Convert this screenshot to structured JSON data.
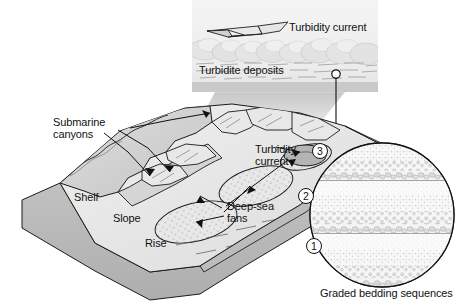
{
  "figure": {
    "background_color": "#ffffff"
  },
  "inset_panel": {
    "name": "turbidity-current-inset",
    "turbidity_current_label": "Turbidity current",
    "turbidite_deposits_label": "Turbidite deposits",
    "arrow_direction": "left",
    "panel_bounds": {
      "x": 192,
      "y": 0,
      "width": 186,
      "height": 92
    },
    "background_color": "#f2f2f2"
  },
  "block_diagram": {
    "name": "continental-margin-block",
    "labels": {
      "submarine_canyons": "Submarine\ncanyons",
      "submarine_canyons_line1": "Submarine",
      "submarine_canyons_line2": "canyons",
      "shelf": "Shelf",
      "slope": "Slope",
      "rise": "Rise",
      "turbidity_current_line1": "Turbidity",
      "turbidity_current_line2": "current",
      "deep_sea_fans_line1": "Deep-sea",
      "deep_sea_fans_line2": "fans"
    },
    "colors": {
      "land": "#d8d8d8",
      "shelf": "#c9c9c9",
      "slope": "#e0e0e0",
      "seafloor": "#ebebeb",
      "fan": "#e5e5e5",
      "front_face": "#b9b9b9",
      "side_face": "#a8a8a8",
      "outline": "#1a1a1a"
    }
  },
  "magnifier": {
    "name": "graded-bedding-magnifier",
    "caption": "Graded bedding sequences",
    "sequence_labels": [
      "1",
      "2",
      "3"
    ],
    "sequence_label_1": "1",
    "sequence_label_2": "2",
    "sequence_label_3": "3",
    "circle": {
      "cx": 382,
      "cy": 215,
      "r": 72
    },
    "colors": {
      "fill": "#f7f7f7",
      "grain": "#cfcfcf",
      "outline": "#1a1a1a"
    }
  },
  "connectors": {
    "wedge_name": "inset-zoom-wedge",
    "leader_name": "magnifier-leader-line",
    "marker_name": "zoom-point-marker"
  }
}
